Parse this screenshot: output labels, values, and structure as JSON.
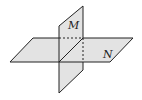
{
  "diagram": {
    "labels": {
      "plane_vertical": "M",
      "plane_horizontal": "N"
    },
    "colors": {
      "fill": "#e3e3e3",
      "stroke": "#222222",
      "background": "#ffffff"
    }
  }
}
